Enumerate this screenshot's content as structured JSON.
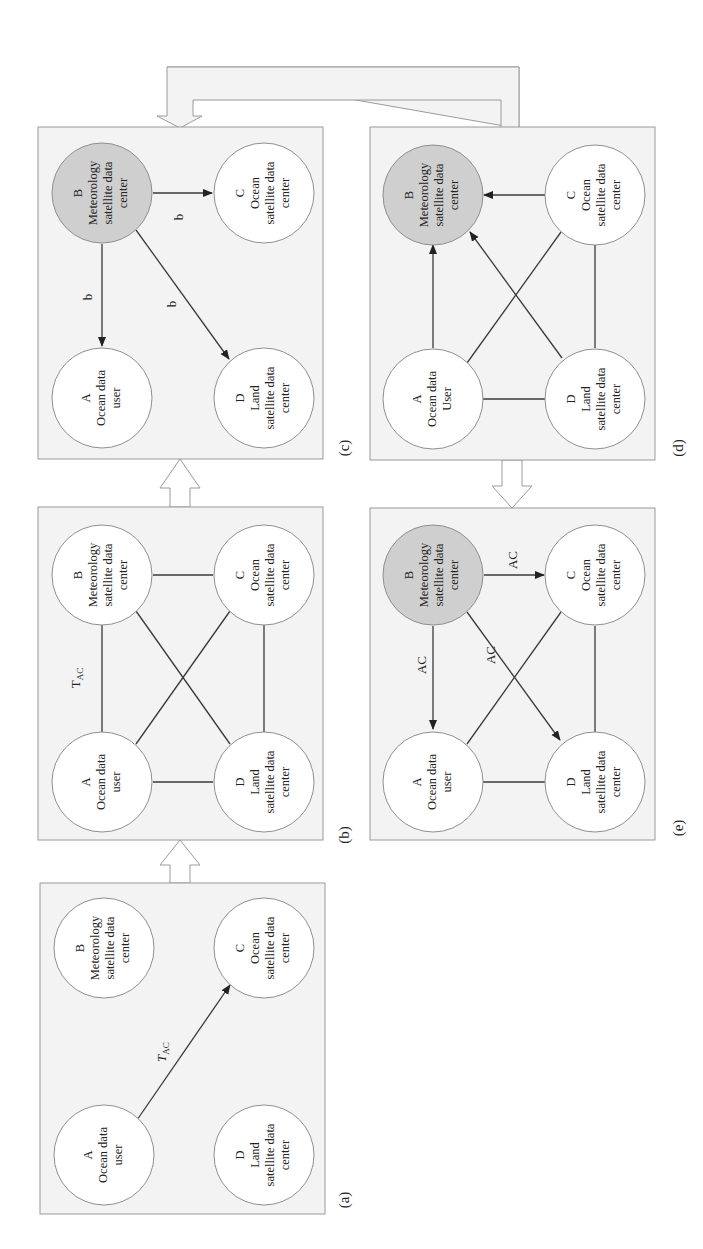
{
  "figure": {
    "orientation": "rotated 90 degrees counter-clockwise",
    "colors": {
      "panel_background": "#f3f3f3",
      "panel_border": "#9a9a9a",
      "highlight_node": "#cfcfcf",
      "plain_node": "#ffffff",
      "edge": "#3a3a3a"
    },
    "nodes": {
      "A": {
        "letter": "A",
        "line1": "Ocean data",
        "line2": "user"
      },
      "A_d": {
        "letter": "A",
        "line1": "Ocean data",
        "line2": "User"
      },
      "B": {
        "letter": "B",
        "line1": "Meteorology",
        "line2": "satellite data",
        "line3": "center"
      },
      "C": {
        "letter": "C",
        "line1": "Ocean",
        "line2": "satellite data",
        "line3": "center"
      },
      "D": {
        "letter": "D",
        "line1": "Land",
        "line2": "satellite data",
        "line3": "center"
      }
    },
    "panels": {
      "a": {
        "label": "(a)",
        "edge_label_T": "T",
        "edge_label_sub": "AC",
        "edges": [
          {
            "from": "A",
            "to": "C",
            "directed": true,
            "label": "T_AC"
          }
        ],
        "highlighted": []
      },
      "b": {
        "label": "(b)",
        "edge_label_T": "T",
        "edge_label_sub": "AC",
        "edges": [
          {
            "from": "A",
            "to": "B",
            "directed": false
          },
          {
            "from": "A",
            "to": "C",
            "directed": false
          },
          {
            "from": "A",
            "to": "D",
            "directed": false
          },
          {
            "from": "B",
            "to": "C",
            "directed": false
          },
          {
            "from": "B",
            "to": "D",
            "directed": false
          },
          {
            "from": "C",
            "to": "D",
            "directed": false
          }
        ],
        "highlighted": []
      },
      "c": {
        "label": "(c)",
        "edge_label": "b",
        "edges": [
          {
            "from": "B",
            "to": "A",
            "directed": true,
            "label": "b"
          },
          {
            "from": "B",
            "to": "C",
            "directed": true,
            "label": "b"
          },
          {
            "from": "B",
            "to": "D",
            "directed": true,
            "label": "b"
          }
        ],
        "highlighted": [
          "B"
        ]
      },
      "d": {
        "label": "(d)",
        "edges": [
          {
            "from": "A",
            "to": "B",
            "directed": true
          },
          {
            "from": "C",
            "to": "B",
            "directed": true
          },
          {
            "from": "D",
            "to": "B",
            "directed": true
          },
          {
            "from": "A",
            "to": "C",
            "directed": false
          },
          {
            "from": "A",
            "to": "D",
            "directed": false
          },
          {
            "from": "C",
            "to": "D",
            "directed": false
          }
        ],
        "highlighted": [
          "B"
        ]
      },
      "e": {
        "label": "(e)",
        "edge_label": "AC",
        "edges": [
          {
            "from": "B",
            "to": "A",
            "directed": true,
            "label": "AC"
          },
          {
            "from": "B",
            "to": "C",
            "directed": true,
            "label": "AC"
          },
          {
            "from": "B",
            "to": "D",
            "directed": true,
            "label": "AC"
          },
          {
            "from": "A",
            "to": "C",
            "directed": false
          },
          {
            "from": "A",
            "to": "D",
            "directed": false
          },
          {
            "from": "C",
            "to": "D",
            "directed": false
          }
        ],
        "highlighted": [
          "B"
        ]
      }
    },
    "flow": [
      "(a) -> (b)",
      "(b) -> (c)",
      "(c) -> (d)",
      "(d) -> (e)"
    ]
  }
}
